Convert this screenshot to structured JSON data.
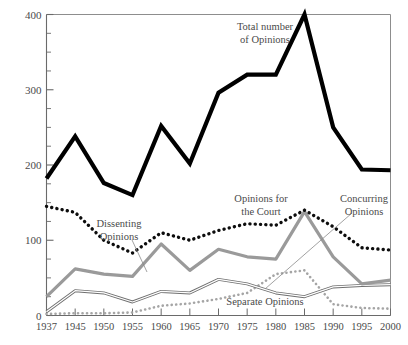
{
  "chart_data": {
    "type": "line",
    "title": "",
    "subtitle": "",
    "xlabel": "",
    "ylabel": "",
    "xlim": [
      1937,
      2000
    ],
    "ylim": [
      0,
      400
    ],
    "grid": false,
    "legend_position": "inline-annotations",
    "x": [
      1937,
      1945,
      1950,
      1955,
      1960,
      1965,
      1970,
      1975,
      1980,
      1985,
      1990,
      1995,
      2000
    ],
    "x_tick_labels": [
      "1937",
      "1945",
      "1950",
      "1955",
      "1960",
      "1965",
      "1970",
      "1975",
      "1980",
      "1985",
      "1990",
      "1995",
      "2000"
    ],
    "y_tick_labels": [
      "0",
      "100",
      "200",
      "300",
      "400"
    ],
    "y_major_ticks": [
      0,
      100,
      200,
      300,
      400
    ],
    "y_minor_tick_step": 25,
    "series": [
      {
        "name": "Total number of Opinions",
        "style": "thick-solid-black",
        "color": "#000000",
        "values": [
          182,
          238,
          176,
          160,
          252,
          202,
          296,
          320,
          320,
          400,
          250,
          194,
          193
        ]
      },
      {
        "name": "Opinions for the Court",
        "style": "dotted-black",
        "color": "#0d0d0d",
        "values": [
          145,
          137,
          100,
          83,
          110,
          100,
          113,
          122,
          120,
          140,
          118,
          90,
          87
        ]
      },
      {
        "name": "Dissenting Opinions",
        "style": "thick-solid-gray",
        "color": "#9a9a9a",
        "values": [
          25,
          62,
          55,
          52,
          95,
          60,
          88,
          78,
          75,
          138,
          78,
          42,
          47
        ]
      },
      {
        "name": "Concurring Opinions",
        "style": "thin-double-gray",
        "color": "#6f6f6f",
        "values": [
          5,
          33,
          30,
          18,
          32,
          30,
          48,
          42,
          30,
          25,
          38,
          40,
          41
        ]
      },
      {
        "name": "Separate Opinions",
        "style": "dotted-gray",
        "color": "#a5a5a5",
        "values": [
          2,
          3,
          3,
          4,
          13,
          16,
          22,
          30,
          55,
          60,
          15,
          10,
          9
        ]
      }
    ],
    "annotations": [
      {
        "id": "total-opinions",
        "text_lines": [
          "Total number",
          "of Opinions"
        ],
        "x": 265,
        "y": 30
      },
      {
        "id": "dissenting-opinions",
        "text_lines": [
          "Dissenting",
          "Opinions"
        ],
        "x": 119,
        "y": 227
      },
      {
        "id": "opinions-for-the-court",
        "text_lines": [
          "Opinions for",
          "the Court"
        ],
        "x": 261,
        "y": 202
      },
      {
        "id": "concurring-opinions",
        "text_lines": [
          "Concurring",
          "Opinions"
        ],
        "x": 364,
        "y": 202
      },
      {
        "id": "separate-opinions",
        "text_lines": [
          "Separate Opinions"
        ],
        "x": 265,
        "y": 305
      }
    ]
  }
}
